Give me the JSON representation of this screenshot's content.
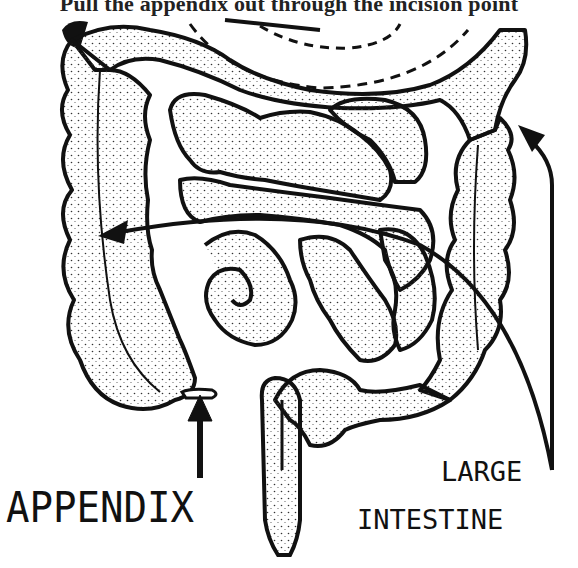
{
  "figure": {
    "caption_top": "Pull the appendix out through the incision point",
    "labels": {
      "appendix": "APPENDIX",
      "large_intestine_line1": "LARGE",
      "large_intestine_line2": "INTESTINE"
    },
    "style": {
      "ink": "#111111",
      "background": "#ffffff"
    }
  }
}
